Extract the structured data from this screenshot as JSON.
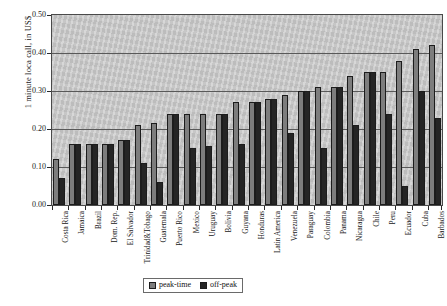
{
  "chart_data": {
    "type": "bar",
    "title": "",
    "xlabel": "",
    "ylabel": "1 minute loca call, in US$",
    "ylim": [
      0.0,
      0.5
    ],
    "ytick_labels": [
      "0.50",
      "0.40",
      "0.30",
      "0.20",
      "0.10",
      "0.00"
    ],
    "ytick_values": [
      0.5,
      0.4,
      0.3,
      0.2,
      0.1,
      0.0
    ],
    "grid": true,
    "legend_position": "bottom-center",
    "categories": [
      "Costa Rica",
      "Jamaica",
      "Brazil",
      "Dom. Rep.",
      "El Salvador",
      "Trinidad&Tobago",
      "Guatemala",
      "Puerto Rico",
      "Mexico",
      "Uruguay",
      "Bolivia",
      "Guyana",
      "Honduras",
      "Latin America",
      "Venezuela",
      "Paraguay",
      "Colombia",
      "Panama",
      "Nicaragua",
      "Chile",
      "Peru",
      "Ecuador",
      "Cuba",
      "Barbados"
    ],
    "series": [
      {
        "name": "peak-time",
        "color": "#7d7d7d",
        "values": [
          0.12,
          0.16,
          0.16,
          0.16,
          0.17,
          0.21,
          0.215,
          0.24,
          0.24,
          0.24,
          0.24,
          0.27,
          0.27,
          0.28,
          0.29,
          0.3,
          0.31,
          0.31,
          0.34,
          0.35,
          0.35,
          0.38,
          0.41,
          0.42
        ]
      },
      {
        "name": "off-peak",
        "color": "#252525",
        "values": [
          0.07,
          0.16,
          0.16,
          0.16,
          0.17,
          0.11,
          0.06,
          0.24,
          0.15,
          0.155,
          0.24,
          0.16,
          0.27,
          0.28,
          0.19,
          0.3,
          0.15,
          0.31,
          0.21,
          0.35,
          0.24,
          0.05,
          0.3,
          0.23
        ]
      }
    ],
    "legend": [
      {
        "label": "peak-time",
        "swatch": "peak"
      },
      {
        "label": "off-peak",
        "swatch": "offpeak"
      }
    ]
  }
}
